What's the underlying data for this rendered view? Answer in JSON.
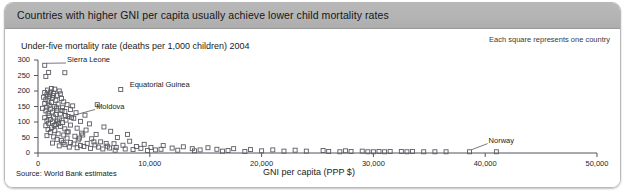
{
  "header": {
    "title": "Countries with higher GNI per capita usually achieve lower child mortality rates",
    "bar_color": "#b4b4b4"
  },
  "panel": {
    "note": "Each square represents one country",
    "source": "Source: World Bank estimates",
    "background": "#ffffff"
  },
  "chart_data": {
    "type": "scatter",
    "title": "Countries with higher GNI per capita usually achieve lower child mortality rates",
    "subtitle": "Under-five mortality rate (deaths per 1,000 children) 2004",
    "xlabel": "GNI per capita (PPP $)",
    "ylabel": "Under-five mortality rate (deaths per 1,000 children) 2004",
    "xlim": [
      0,
      50000
    ],
    "ylim": [
      0,
      300
    ],
    "xticks": [
      0,
      10000,
      20000,
      30000,
      40000,
      50000
    ],
    "xtick_labels": [
      "0",
      "10,000",
      "20,000",
      "30,000",
      "40,000",
      "50,000"
    ],
    "yticks": [
      0,
      50,
      100,
      150,
      200,
      250,
      300
    ],
    "ytick_labels": [
      "0",
      "50",
      "100",
      "150",
      "200",
      "250",
      "300"
    ],
    "grid": false,
    "legend": "Each square represents one country",
    "legend_position": "top-right",
    "marker": "open-square",
    "marker_color": "#5b5b63",
    "source": "Source: World Bank estimates",
    "annotations": [
      {
        "label": "Sierra Leone",
        "x": 600,
        "y": 283,
        "label_x": 2600,
        "label_y": 300,
        "leader": true
      },
      {
        "label": "Equatorial Guinea",
        "x": 7400,
        "y": 205,
        "label_x": 8200,
        "label_y": 218,
        "leader": false
      },
      {
        "label": "Moldova",
        "x": 1750,
        "y": 103,
        "label_x": 5200,
        "label_y": 150,
        "leader": true
      },
      {
        "label": "Norway",
        "x": 38600,
        "y": 4,
        "label_x": 40300,
        "label_y": 40,
        "leader": true
      }
    ],
    "points": [
      {
        "x": 600,
        "y": 283
      },
      {
        "x": 950,
        "y": 260
      },
      {
        "x": 2400,
        "y": 259
      },
      {
        "x": 700,
        "y": 247
      },
      {
        "x": 1200,
        "y": 208
      },
      {
        "x": 1500,
        "y": 206
      },
      {
        "x": 850,
        "y": 203
      },
      {
        "x": 1900,
        "y": 200
      },
      {
        "x": 1100,
        "y": 197
      },
      {
        "x": 600,
        "y": 195
      },
      {
        "x": 1400,
        "y": 192
      },
      {
        "x": 2000,
        "y": 191
      },
      {
        "x": 800,
        "y": 188
      },
      {
        "x": 1700,
        "y": 186
      },
      {
        "x": 1000,
        "y": 183
      },
      {
        "x": 500,
        "y": 180
      },
      {
        "x": 1300,
        "y": 178
      },
      {
        "x": 2100,
        "y": 176
      },
      {
        "x": 700,
        "y": 172
      },
      {
        "x": 1600,
        "y": 170
      },
      {
        "x": 900,
        "y": 168
      },
      {
        "x": 2300,
        "y": 165
      },
      {
        "x": 1200,
        "y": 163
      },
      {
        "x": 600,
        "y": 160
      },
      {
        "x": 1800,
        "y": 158
      },
      {
        "x": 2600,
        "y": 156
      },
      {
        "x": 1000,
        "y": 154
      },
      {
        "x": 3100,
        "y": 152
      },
      {
        "x": 1500,
        "y": 150
      },
      {
        "x": 800,
        "y": 148
      },
      {
        "x": 2200,
        "y": 146
      },
      {
        "x": 400,
        "y": 144
      },
      {
        "x": 1100,
        "y": 142
      },
      {
        "x": 2900,
        "y": 140
      },
      {
        "x": 1700,
        "y": 138
      },
      {
        "x": 700,
        "y": 136
      },
      {
        "x": 2400,
        "y": 134
      },
      {
        "x": 1300,
        "y": 132
      },
      {
        "x": 3400,
        "y": 130
      },
      {
        "x": 900,
        "y": 128
      },
      {
        "x": 2000,
        "y": 126
      },
      {
        "x": 1600,
        "y": 124
      },
      {
        "x": 5300,
        "y": 156
      },
      {
        "x": 7400,
        "y": 205
      },
      {
        "x": 4200,
        "y": 122
      },
      {
        "x": 1000,
        "y": 120
      },
      {
        "x": 2700,
        "y": 118
      },
      {
        "x": 1400,
        "y": 116
      },
      {
        "x": 600,
        "y": 114
      },
      {
        "x": 3200,
        "y": 112
      },
      {
        "x": 1900,
        "y": 110
      },
      {
        "x": 1100,
        "y": 108
      },
      {
        "x": 2500,
        "y": 106
      },
      {
        "x": 800,
        "y": 104
      },
      {
        "x": 1750,
        "y": 103
      },
      {
        "x": 3800,
        "y": 102
      },
      {
        "x": 1300,
        "y": 100
      },
      {
        "x": 2200,
        "y": 98
      },
      {
        "x": 950,
        "y": 96
      },
      {
        "x": 4600,
        "y": 94
      },
      {
        "x": 1600,
        "y": 92
      },
      {
        "x": 2900,
        "y": 90
      },
      {
        "x": 700,
        "y": 88
      },
      {
        "x": 2000,
        "y": 86
      },
      {
        "x": 5900,
        "y": 84
      },
      {
        "x": 1200,
        "y": 82
      },
      {
        "x": 3500,
        "y": 80
      },
      {
        "x": 2400,
        "y": 78
      },
      {
        "x": 900,
        "y": 76
      },
      {
        "x": 4300,
        "y": 74
      },
      {
        "x": 1500,
        "y": 72
      },
      {
        "x": 6500,
        "y": 70
      },
      {
        "x": 2700,
        "y": 68
      },
      {
        "x": 1100,
        "y": 66
      },
      {
        "x": 3900,
        "y": 64
      },
      {
        "x": 1800,
        "y": 62
      },
      {
        "x": 5200,
        "y": 60
      },
      {
        "x": 2300,
        "y": 58
      },
      {
        "x": 800,
        "y": 56
      },
      {
        "x": 3300,
        "y": 54
      },
      {
        "x": 1400,
        "y": 52
      },
      {
        "x": 7100,
        "y": 50
      },
      {
        "x": 2600,
        "y": 48
      },
      {
        "x": 4800,
        "y": 46
      },
      {
        "x": 1700,
        "y": 44
      },
      {
        "x": 3600,
        "y": 42
      },
      {
        "x": 2100,
        "y": 40
      },
      {
        "x": 8200,
        "y": 38
      },
      {
        "x": 5600,
        "y": 36
      },
      {
        "x": 2900,
        "y": 34
      },
      {
        "x": 1300,
        "y": 32
      },
      {
        "x": 4400,
        "y": 31
      },
      {
        "x": 6800,
        "y": 30
      },
      {
        "x": 3200,
        "y": 29
      },
      {
        "x": 9500,
        "y": 28
      },
      {
        "x": 2400,
        "y": 27
      },
      {
        "x": 5100,
        "y": 26
      },
      {
        "x": 7600,
        "y": 25
      },
      {
        "x": 3800,
        "y": 24
      },
      {
        "x": 11200,
        "y": 24
      },
      {
        "x": 1900,
        "y": 23
      },
      {
        "x": 6200,
        "y": 22
      },
      {
        "x": 4100,
        "y": 21
      },
      {
        "x": 8800,
        "y": 21
      },
      {
        "x": 13000,
        "y": 20
      },
      {
        "x": 2800,
        "y": 19
      },
      {
        "x": 5400,
        "y": 19
      },
      {
        "x": 10100,
        "y": 18
      },
      {
        "x": 7000,
        "y": 18
      },
      {
        "x": 3500,
        "y": 17
      },
      {
        "x": 15200,
        "y": 17
      },
      {
        "x": 12000,
        "y": 16
      },
      {
        "x": 6400,
        "y": 16
      },
      {
        "x": 4700,
        "y": 15
      },
      {
        "x": 9200,
        "y": 15
      },
      {
        "x": 17500,
        "y": 14
      },
      {
        "x": 13800,
        "y": 14
      },
      {
        "x": 7800,
        "y": 13
      },
      {
        "x": 5800,
        "y": 13
      },
      {
        "x": 11000,
        "y": 12
      },
      {
        "x": 16000,
        "y": 12
      },
      {
        "x": 8500,
        "y": 11
      },
      {
        "x": 19000,
        "y": 11
      },
      {
        "x": 14500,
        "y": 10
      },
      {
        "x": 10500,
        "y": 10
      },
      {
        "x": 21000,
        "y": 10
      },
      {
        "x": 6900,
        "y": 9
      },
      {
        "x": 12500,
        "y": 9
      },
      {
        "x": 23000,
        "y": 9
      },
      {
        "x": 17000,
        "y": 8
      },
      {
        "x": 9800,
        "y": 8
      },
      {
        "x": 25500,
        "y": 8
      },
      {
        "x": 20000,
        "y": 7
      },
      {
        "x": 14000,
        "y": 7
      },
      {
        "x": 27500,
        "y": 7
      },
      {
        "x": 22000,
        "y": 6
      },
      {
        "x": 16500,
        "y": 6
      },
      {
        "x": 29000,
        "y": 6
      },
      {
        "x": 24000,
        "y": 6
      },
      {
        "x": 18500,
        "y": 5
      },
      {
        "x": 30500,
        "y": 5
      },
      {
        "x": 26000,
        "y": 5
      },
      {
        "x": 31500,
        "y": 5
      },
      {
        "x": 28000,
        "y": 5
      },
      {
        "x": 32500,
        "y": 5
      },
      {
        "x": 33500,
        "y": 5
      },
      {
        "x": 34500,
        "y": 4
      },
      {
        "x": 35500,
        "y": 4
      },
      {
        "x": 30000,
        "y": 4
      },
      {
        "x": 36500,
        "y": 4
      },
      {
        "x": 31000,
        "y": 4
      },
      {
        "x": 38600,
        "y": 4
      },
      {
        "x": 41000,
        "y": 4
      },
      {
        "x": 33000,
        "y": 4
      },
      {
        "x": 29500,
        "y": 4
      },
      {
        "x": 27000,
        "y": 4
      },
      {
        "x": 3000,
        "y": 115
      },
      {
        "x": 2600,
        "y": 68
      },
      {
        "x": 4000,
        "y": 58
      },
      {
        "x": 1050,
        "y": 190
      },
      {
        "x": 1350,
        "y": 185
      },
      {
        "x": 1650,
        "y": 145
      },
      {
        "x": 2150,
        "y": 137
      },
      {
        "x": 2450,
        "y": 121
      },
      {
        "x": 1850,
        "y": 95
      },
      {
        "x": 1450,
        "y": 89
      },
      {
        "x": 3700,
        "y": 48
      },
      {
        "x": 5000,
        "y": 36
      },
      {
        "x": 6100,
        "y": 31
      },
      {
        "x": 2250,
        "y": 33
      },
      {
        "x": 8000,
        "y": 60
      }
    ]
  }
}
